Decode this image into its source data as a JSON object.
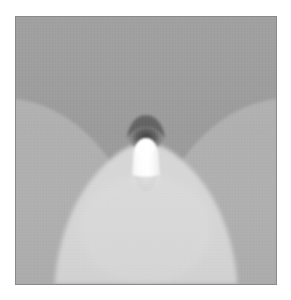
{
  "figure": {
    "kind": "grayscale-field-visualization",
    "width_px": 291,
    "height_px": 300,
    "background_color": "#ffffff",
    "plate": {
      "left_px": 15,
      "top_px": 16,
      "width_px": 262,
      "height_px": 269,
      "border_color": "#8a8a8a",
      "border_width_px": 1
    }
  },
  "chart_data": {
    "type": "heatmap",
    "title": "",
    "subtitle": "",
    "xlabel": "",
    "ylabel": "",
    "legend": "none",
    "grid": false,
    "colormap": "grayscale",
    "xlim": [
      0,
      262
    ],
    "ylim": [
      0,
      269
    ],
    "colorbar_shown": false,
    "value_levels": [
      {
        "name": "upper-field-dark-gray",
        "color": "#9b9b9b",
        "intensity": 0.38
      },
      {
        "name": "side-lobe-mid-gray",
        "color": "#afafaf",
        "intensity": 0.52
      },
      {
        "name": "lower-main-lobe-light-gray",
        "color": "#d6d6d6",
        "intensity": 0.78
      },
      {
        "name": "focal-shadow-dark",
        "color": "#4c4c4c",
        "intensity": 0.12
      },
      {
        "name": "emitter-highlight-white",
        "color": "#fdfdfd",
        "intensity": 1.0
      }
    ],
    "regions": [
      {
        "name": "upper-background-lobe",
        "shape": "full-field",
        "color": "#9b9b9b",
        "note": "darker gray fills the upper half and converges to the focal point"
      },
      {
        "name": "left-side-lobe",
        "shape": "quarter-ellipse",
        "color": "#afafaf",
        "anchor": "left-edge",
        "center_px": [
          -10,
          300
        ],
        "radius_x_px": 150,
        "radius_y_px": 215
      },
      {
        "name": "right-side-lobe",
        "shape": "quarter-ellipse",
        "color": "#afafaf",
        "anchor": "right-edge",
        "center_px": [
          272,
          300
        ],
        "radius_x_px": 150,
        "radius_y_px": 215
      },
      {
        "name": "lower-main-lobe",
        "shape": "parabolic-bell",
        "color": "#d6d6d6",
        "apex_px": [
          131,
          130
        ],
        "base_half_width_px": 92,
        "base_y_px": 269
      },
      {
        "name": "focal-shadow",
        "shape": "dark-cap-arc",
        "color": "#4c4c4c",
        "center_px": [
          131,
          120
        ],
        "radius_x_px": 18,
        "radius_y_px": 14
      },
      {
        "name": "emitter-capsule",
        "shape": "rounded-capsule",
        "color": "#fdfdfd",
        "center_px": [
          131,
          143
        ],
        "width_px": 26,
        "height_px": 42
      },
      {
        "name": "emitter-soft-tail",
        "shape": "blurred-ellipse",
        "color": "#e8e8e8",
        "center_px": [
          131,
          164
        ],
        "width_px": 30,
        "height_px": 26
      }
    ],
    "annotations": []
  }
}
